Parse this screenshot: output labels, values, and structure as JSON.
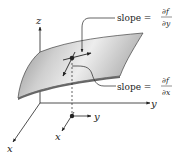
{
  "diagram": {
    "type": "3d-surface-partial-derivatives",
    "axes": {
      "z_label": "z",
      "y_label": "y",
      "x_label": "x"
    },
    "local_axes": {
      "y_label": "y",
      "x_label": "x"
    },
    "annotations": [
      {
        "id": "slope_y",
        "prefix": "slope =",
        "numerator": "∂f",
        "denominator": "∂y"
      },
      {
        "id": "slope_x",
        "prefix": "slope =",
        "numerator": "∂f",
        "denominator": "∂x"
      }
    ],
    "colors": {
      "surface_fill_dark": "#8a8a8a",
      "surface_fill_light": "#e6e6e6",
      "line": "#222222",
      "background": "#ffffff"
    }
  }
}
